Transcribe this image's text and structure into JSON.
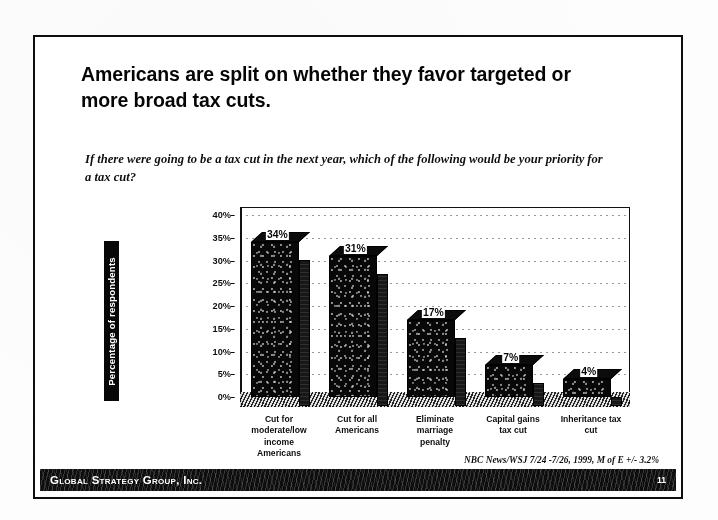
{
  "slide": {
    "title": "Americans are split on whether they favor targeted or more broad tax cuts.",
    "question": "If there were going to be a tax cut in the next year, which of the following would be your priority for a tax cut?",
    "source_note": "NBC News/WSJ 7/24 -7/26, 1999, M of E +/- 3.2%"
  },
  "footer": {
    "brand": "Global Strategy Group, Inc.",
    "page_number": "11"
  },
  "chart_data": {
    "type": "bar",
    "title": "",
    "xlabel": "",
    "ylabel": "Percentage of respondents",
    "categories": [
      "Cut for moderate/low income Americans",
      "Cut for all Americans",
      "Eliminate marriage penalty",
      "Capital gains tax cut",
      "Inheritance tax cut"
    ],
    "category_lines": [
      [
        "Cut for",
        "moderate/low",
        "income",
        "Americans"
      ],
      [
        "Cut for all",
        "Americans"
      ],
      [
        "Eliminate",
        "marriage",
        "penalty"
      ],
      [
        "Capital gains",
        "tax cut"
      ],
      [
        "Inheritance tax",
        "cut"
      ]
    ],
    "values": [
      34,
      31,
      17,
      7,
      4
    ],
    "data_labels": [
      "34%",
      "31%",
      "17%",
      "7%",
      "4%"
    ],
    "ylim": [
      0,
      40
    ],
    "ytick_values": [
      0,
      5,
      10,
      15,
      20,
      25,
      30,
      35,
      40
    ],
    "ytick_labels": [
      "0%",
      "5%",
      "10%",
      "15%",
      "20%",
      "25%",
      "30%",
      "35%",
      "40%"
    ],
    "grid": true,
    "legend": "none",
    "bar_color": "#0d0d0d",
    "three_d": true
  }
}
